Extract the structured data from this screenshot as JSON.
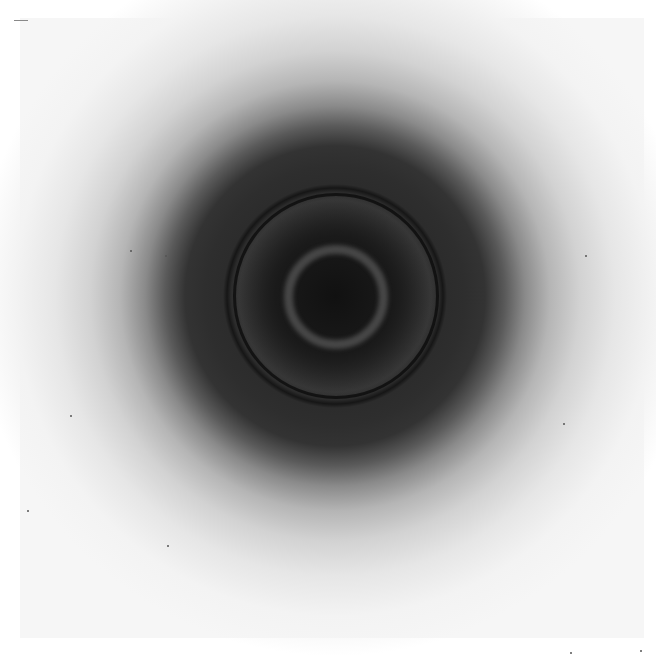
{
  "image": {
    "description": "Photograph of a circular diffraction pattern with concentric rings",
    "width": 656,
    "height": 660,
    "center": {
      "x": 335,
      "y": 296
    },
    "rings": [
      {
        "name": "central-disk",
        "radius": 35,
        "tone": "very dark"
      },
      {
        "name": "inner-bright-ring",
        "radius": 48,
        "tone": "medium gray"
      },
      {
        "name": "sharp-dark-ring",
        "radius": 103,
        "tone": "black line"
      },
      {
        "name": "dark-halo",
        "radius": 165,
        "tone": "dark gray fading"
      },
      {
        "name": "outer-diffuse-halo",
        "radius": 280,
        "tone": "light gray"
      }
    ],
    "colors": {
      "background": "#ffffff",
      "plate": "#f6f6f6",
      "core": "#151515",
      "halo": "#2e2e2e"
    }
  }
}
